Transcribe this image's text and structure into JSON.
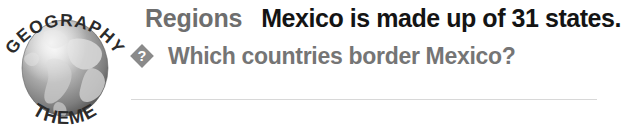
{
  "callout": {
    "logo": {
      "arc_top_text": "GEOGRAPHY",
      "arc_bottom_text": "THEME",
      "icon_name": "globe-icon"
    },
    "theme_label": "Regions",
    "headline": "Mexico is made up of 31 states.",
    "question": {
      "icon_name": "diamond-question-mark-icon",
      "text": "Which countries border Mexico?"
    },
    "colors": {
      "theme_label": "#6e6e6e",
      "headline": "#141414",
      "question_text": "#757575",
      "question_icon": "#8a8a8a",
      "divider": "#d8d8d8",
      "background": "#ffffff"
    }
  }
}
